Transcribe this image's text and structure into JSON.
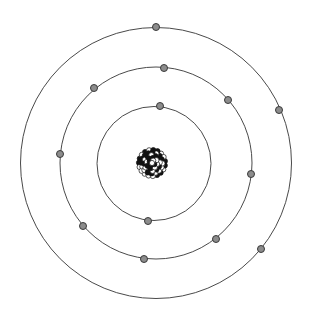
{
  "diagram": {
    "nucleus": {
      "cx": 152,
      "cy": 163,
      "r": 16,
      "particle_colors": [
        "#111111",
        "#ffffff"
      ]
    },
    "orbits": [
      {
        "name": "inner-shell",
        "cx": 154,
        "cy": 163.5,
        "r": 57,
        "electrons": [
          [
            160,
            106
          ],
          [
            148,
            221
          ]
        ]
      },
      {
        "name": "middle-shell",
        "cx": 156,
        "cy": 163,
        "r": 96,
        "electrons": [
          [
            164,
            68
          ],
          [
            94,
            88
          ],
          [
            228,
            100
          ],
          [
            60,
            154
          ],
          [
            251,
            174
          ],
          [
            83,
            226
          ],
          [
            216,
            239
          ],
          [
            144,
            259
          ]
        ]
      },
      {
        "name": "outer-shell",
        "cx": 156,
        "cy": 163,
        "r": 135.5,
        "electrons": [
          [
            156,
            27
          ],
          [
            279,
            110
          ],
          [
            261,
            249
          ]
        ]
      }
    ],
    "electron_radius": 3.5,
    "electron_color": "#8c8c8c",
    "orbit_color": "#4a4a4a"
  }
}
